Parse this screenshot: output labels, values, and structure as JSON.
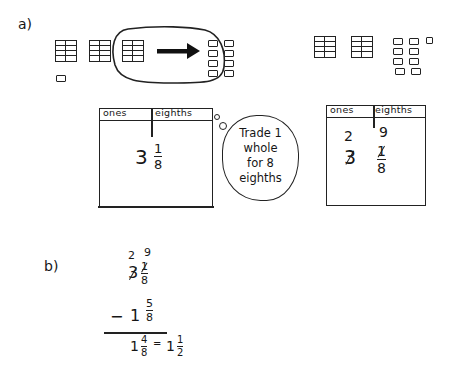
{
  "part_a": {
    "label": "a)",
    "before": {
      "flats": 3,
      "loose_pieces": 1,
      "regrouped_flat_to": 8
    },
    "after": {
      "flats": 2,
      "loose_pieces": 9
    },
    "table_left": {
      "headers": [
        "ones",
        "eighths"
      ],
      "whole": "3",
      "numerator": "1",
      "denominator": "8"
    },
    "thought_bubble": {
      "lines": [
        "Trade 1",
        "whole",
        "for 8",
        "eighths"
      ]
    },
    "table_right": {
      "headers": [
        "ones",
        "eighths"
      ],
      "new_whole": "2",
      "new_numerator": "9",
      "old_whole_struck": "3",
      "old_numerator_struck": "1",
      "denominator": "8"
    }
  },
  "part_b": {
    "label": "b)",
    "regroup_whole": "2",
    "regroup_numerator": "9",
    "minuend_whole": "3",
    "minuend_numerator": "1",
    "minuend_denominator": "8",
    "operator": "−",
    "subtrahend_whole": "1",
    "subtrahend_numerator": "5",
    "subtrahend_denominator": "8",
    "result_whole": "1",
    "result_numerator": "4",
    "result_denominator": "8",
    "equals": "=",
    "simplified_whole": "1",
    "simplified_numerator": "1",
    "simplified_denominator": "2"
  }
}
